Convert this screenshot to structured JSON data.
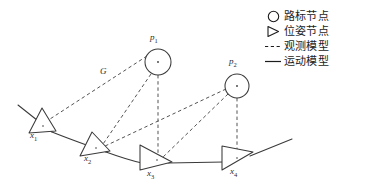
{
  "figure": {
    "background_color": "#ffffff",
    "stroke_color": "#3a3a3a",
    "label_color": "#2b2b2b"
  },
  "legend": {
    "items": [
      {
        "glyph": "circle-outline-icon",
        "label": "路标节点"
      },
      {
        "glyph": "triangle-outline-icon",
        "label": "位姿节点"
      },
      {
        "glyph": "dashed-line-icon",
        "label": "观测模型"
      },
      {
        "glyph": "solid-line-icon",
        "label": "运动模型"
      }
    ]
  },
  "diagram": {
    "edge_label": "G",
    "pose_nodes": [
      {
        "id": "x1",
        "label": "x",
        "sub": "1",
        "cx": 40,
        "cy": 122,
        "label_x": 30,
        "label_y": 138
      },
      {
        "id": "x2",
        "label": "x",
        "sub": "2",
        "cx": 94,
        "cy": 145,
        "label_x": 84,
        "label_y": 161
      },
      {
        "id": "x3",
        "label": "x",
        "sub": "3",
        "cx": 156,
        "cy": 157,
        "label_x": 147,
        "label_y": 174
      },
      {
        "id": "x4",
        "label": "x",
        "sub": "4",
        "cx": 236,
        "cy": 156,
        "label_x": 230,
        "label_y": 172
      }
    ],
    "landmark_nodes": [
      {
        "id": "p1",
        "label": "p",
        "sub": "1",
        "cx": 158,
        "cy": 62,
        "r": 13,
        "label_x": 148,
        "label_y": 38
      },
      {
        "id": "p2",
        "label": "p",
        "sub": "2",
        "cx": 237,
        "cy": 86,
        "r": 12,
        "label_x": 228,
        "label_y": 62
      }
    ],
    "observation_edges": [
      {
        "from": "p1",
        "to": "x1"
      },
      {
        "from": "p1",
        "to": "x2"
      },
      {
        "from": "p1",
        "to": "x3"
      },
      {
        "from": "p2",
        "to": "x2"
      },
      {
        "from": "p2",
        "to": "x3"
      },
      {
        "from": "p2",
        "to": "x4"
      }
    ],
    "motion_edges": [
      {
        "from": "start",
        "to": "x1"
      },
      {
        "from": "x1",
        "to": "x2"
      },
      {
        "from": "x2",
        "to": "x3"
      },
      {
        "from": "x3",
        "to": "x4"
      },
      {
        "from": "x4",
        "to": "end"
      }
    ]
  }
}
